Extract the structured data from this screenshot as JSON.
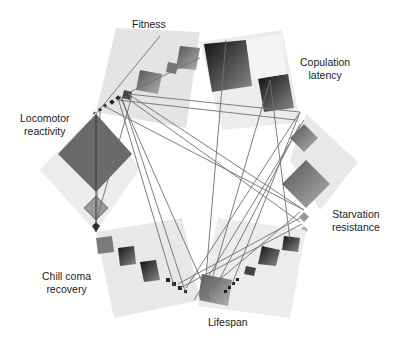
{
  "diagram": {
    "type": "circular-heatmap-network",
    "traits": [
      {
        "id": "fitness",
        "lines": [
          "Fitness"
        ]
      },
      {
        "id": "copulation-latency",
        "lines": [
          "Copulation",
          "latency"
        ]
      },
      {
        "id": "starvation-resistance",
        "lines": [
          "Starvation",
          "resistance"
        ]
      },
      {
        "id": "lifespan",
        "lines": [
          "Lifespan"
        ]
      },
      {
        "id": "chill-coma-recovery",
        "lines": [
          "Chill coma",
          "recovery"
        ]
      },
      {
        "id": "locomotor-reactivity",
        "lines": [
          "Locomotor",
          "reactivity"
        ]
      }
    ],
    "colors": {
      "background": "#ffffff",
      "matrix_light": "#e6e6e6",
      "matrix_mid": "#8a8a8a",
      "matrix_dark": "#2a2a2a",
      "line": "#6e6e6e",
      "text": "#222222"
    }
  }
}
